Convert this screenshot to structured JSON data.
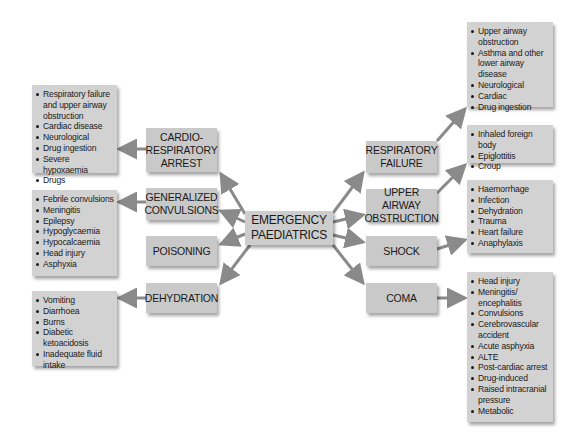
{
  "center": {
    "label_line1": "EMERGENCY",
    "label_line2": "PAEDIATRICS"
  },
  "left_nodes": [
    {
      "label": "CARDIO-RESPIRATORY ARREST",
      "causes": [
        "Respiratory failure and upper airway obstruction",
        "Cardiac disease",
        "Neurological",
        "Drug ingestion",
        "Severe hypoxaemia",
        "Drugs"
      ]
    },
    {
      "label": "GENERALIZED CONVULSIONS",
      "causes": [
        "Febrile convulsions",
        "Meningitis",
        "Epilepsy",
        "Hypoglycaemia",
        "Hypocalcaemia",
        "Head injury",
        "Asphyxia"
      ]
    },
    {
      "label": "POISONING",
      "causes": []
    },
    {
      "label": "DEHYDRATION",
      "causes": [
        "Vomiting",
        "Diarrhoea",
        "Burns",
        "Diabetic ketoacidosis",
        "Inadequate fluid intake"
      ]
    }
  ],
  "right_nodes": [
    {
      "label": "RESPIRATORY FAILURE",
      "causes": [
        "Upper airway obstruction",
        "Asthma and other lower airway disease",
        "Neurological",
        "Cardiac",
        "Drug ingestion"
      ]
    },
    {
      "label": "UPPER AIRWAY OBSTRUCTION",
      "causes": [
        "Inhaled foreign body",
        "Epiglottitis",
        "Croup"
      ]
    },
    {
      "label": "SHOCK",
      "causes": [
        "Haemorrhage",
        "Infection",
        "Dehydration",
        "Trauma",
        "Heart failure",
        "Anaphylaxis"
      ]
    },
    {
      "label": "COMA",
      "causes": [
        "Head injury",
        "Meningitis/ encephalitis",
        "Convulsions",
        "Cerebrovascular accident",
        "Acute asphyxia",
        "ALTE",
        "Post-cardiac arrest",
        "Drug-induced",
        "Raised intracranial pressure",
        "Metabolic"
      ]
    }
  ],
  "labels": {
    "cardio": [
      "CARDIO-",
      "RESPIRATORY",
      "ARREST"
    ],
    "convulsions": [
      "GENERALIZED",
      "CONVULSIONS"
    ],
    "poisoning": [
      "POISONING"
    ],
    "dehydration": [
      "DEHYDRATION"
    ],
    "resp_failure": [
      "RESPIRATORY",
      "FAILURE"
    ],
    "upper_airway": [
      "UPPER AIRWAY",
      "OBSTRUCTION"
    ],
    "shock": [
      "SHOCK"
    ],
    "coma": [
      "COMA"
    ]
  },
  "colors": {
    "box_fill": "#c9c9c9",
    "list_fill": "#d2d2d2",
    "arrow": "#8a8a8a",
    "background": "#ffffff"
  }
}
